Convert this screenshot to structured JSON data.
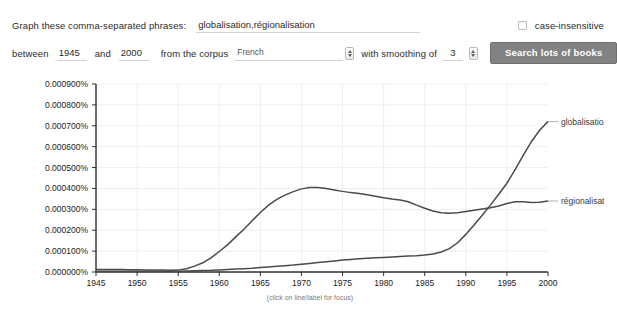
{
  "form": {
    "phrases_label": "Graph these comma-separated phrases:",
    "phrases_value": "globalisation,régionalisation",
    "case_insensitive_label": "case-insensitive",
    "case_insensitive_checked": false,
    "between_label": "between",
    "year_start": "1945",
    "and_label": "and",
    "year_end": "2000",
    "corpus_label": "from the corpus",
    "corpus_value": "French",
    "corpus_options": [
      "French"
    ],
    "smoothing_label": "with smoothing of",
    "smoothing_value": "3",
    "search_button_label": "Search lots of books"
  },
  "chart_data": {
    "type": "line",
    "title": "",
    "subtitle": "",
    "xlabel": "",
    "ylabel": "",
    "hint": "(click on line/label for focus)",
    "grid": true,
    "legend_position": "right-inline",
    "xlim": [
      1945,
      2000
    ],
    "ylim": [
      0.0,
      0.0009
    ],
    "ytick_labels": [
      "0.000900%",
      "0.000800%",
      "0.000700%",
      "0.000600%",
      "0.000500%",
      "0.000400%",
      "0.000300%",
      "0.000200%",
      "0.000100%",
      "0.000000%"
    ],
    "ytick_values": [
      0.0009,
      0.0008,
      0.0007,
      0.0006,
      0.0005,
      0.0004,
      0.0003,
      0.0002,
      0.0001,
      0.0
    ],
    "xtick_labels": [
      "1945",
      "1950",
      "1955",
      "1960",
      "1965",
      "1970",
      "1975",
      "1980",
      "1985",
      "1990",
      "1995",
      "2000"
    ],
    "xtick_values": [
      1945,
      1950,
      1955,
      1960,
      1965,
      1970,
      1975,
      1980,
      1985,
      1990,
      1995,
      2000
    ],
    "x": [
      1945,
      1946,
      1947,
      1948,
      1949,
      1950,
      1951,
      1952,
      1953,
      1954,
      1955,
      1956,
      1957,
      1958,
      1959,
      1960,
      1961,
      1962,
      1963,
      1964,
      1965,
      1966,
      1967,
      1968,
      1969,
      1970,
      1971,
      1972,
      1973,
      1974,
      1975,
      1976,
      1977,
      1978,
      1979,
      1980,
      1981,
      1982,
      1983,
      1984,
      1985,
      1986,
      1987,
      1988,
      1989,
      1990,
      1991,
      1992,
      1993,
      1994,
      1995,
      1996,
      1997,
      1998,
      1999,
      2000
    ],
    "series": [
      {
        "name": "globalisation",
        "color": "#4a4a4a",
        "values": [
          4e-06,
          4e-06,
          4e-06,
          4e-06,
          4e-06,
          4e-06,
          4e-06,
          4e-06,
          4e-06,
          4e-06,
          4e-06,
          5e-06,
          6e-06,
          7e-06,
          8e-06,
          1e-05,
          1.2e-05,
          1.4e-05,
          1.6e-05,
          1.8e-05,
          2.1e-05,
          2.4e-05,
          2.7e-05,
          3e-05,
          3.3e-05,
          3.7e-05,
          4.1e-05,
          4.5e-05,
          4.9e-05,
          5.3e-05,
          5.7e-05,
          6e-05,
          6.3e-05,
          6.6e-05,
          6.8e-05,
          7e-05,
          7.2e-05,
          7.4e-05,
          7.6e-05,
          7.8e-05,
          8.1e-05,
          8.6e-05,
          9.6e-05,
          0.000112,
          0.00014,
          0.00018,
          0.000225,
          0.000272,
          0.00032,
          0.000372,
          0.000425,
          0.00049,
          0.00056,
          0.000625,
          0.00068,
          0.00072
        ]
      },
      {
        "name": "régionalisation",
        "color": "#4a4a4a",
        "values": [
          1.2e-05,
          1.2e-05,
          1.2e-05,
          1.2e-05,
          1.1e-05,
          1.1e-05,
          1e-05,
          9e-06,
          9e-06,
          8e-06,
          9e-06,
          1.6e-05,
          2.8e-05,
          4.4e-05,
          6.8e-05,
          9.8e-05,
          0.00013,
          0.000168,
          0.000205,
          0.000245,
          0.000285,
          0.00032,
          0.000348,
          0.000368,
          0.000385,
          0.000398,
          0.000404,
          0.000405,
          0.0004,
          0.000393,
          0.000386,
          0.00038,
          0.000376,
          0.00037,
          0.000363,
          0.000356,
          0.00035,
          0.000345,
          0.000336,
          0.00032,
          0.000305,
          0.000292,
          0.000284,
          0.000281,
          0.000284,
          0.00029,
          0.000296,
          0.000302,
          0.000308,
          0.000316,
          0.000328,
          0.000336,
          0.000336,
          0.000333,
          0.000334,
          0.00034
        ]
      }
    ],
    "annotations": [
      {
        "text": "globalisation",
        "x": 2000,
        "y": 0.00072
      },
      {
        "text": "régionalisation",
        "x": 2000,
        "y": 0.00034
      }
    ]
  }
}
